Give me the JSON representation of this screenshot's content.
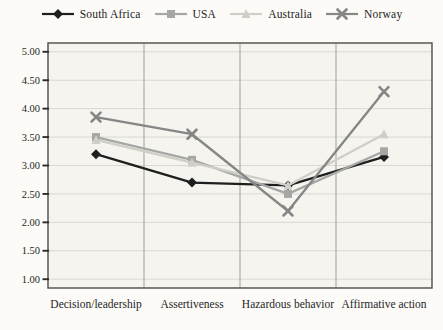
{
  "colors": {
    "page_bg": "#fcfbf8",
    "plot_bg": "#f5f4ef",
    "grid": "#d9d8d2",
    "separator": "#9e9e9e",
    "border": "#4c4c4c",
    "text": "#1f1f1f",
    "south_africa": "#1f1f1f",
    "usa": "#a6a6a6",
    "australia": "#cfcfc7",
    "norway": "#868686"
  },
  "chart_data": {
    "type": "line",
    "title": "",
    "xlabel": "",
    "ylabel": "",
    "categories": [
      "Decision/leadership",
      "Assertiveness",
      "Hazardous behavior",
      "Affirmative action"
    ],
    "series": [
      {
        "name": "South Africa",
        "marker": "diamond",
        "color": "#1f1f1f",
        "values": [
          3.2,
          2.7,
          2.65,
          3.15
        ]
      },
      {
        "name": "USA",
        "marker": "square",
        "color": "#a6a6a6",
        "values": [
          3.5,
          3.1,
          2.5,
          3.25
        ]
      },
      {
        "name": "Australia",
        "marker": "triangle",
        "color": "#cfcfc7",
        "values": [
          3.45,
          3.05,
          2.65,
          3.55
        ]
      },
      {
        "name": "Norway",
        "marker": "x",
        "color": "#868686",
        "values": [
          3.85,
          3.55,
          2.2,
          4.3
        ]
      }
    ],
    "ylim": [
      1.0,
      5.0
    ],
    "ytick_step": 0.5,
    "ytick_labels": [
      "5.00",
      "4.50",
      "4.00",
      "3.50",
      "3.00",
      "2.50",
      "2.00",
      "1.50",
      "1.00"
    ],
    "grid": "horizontal light lines; vertical category separators; full plot border",
    "legend_position": "top"
  }
}
